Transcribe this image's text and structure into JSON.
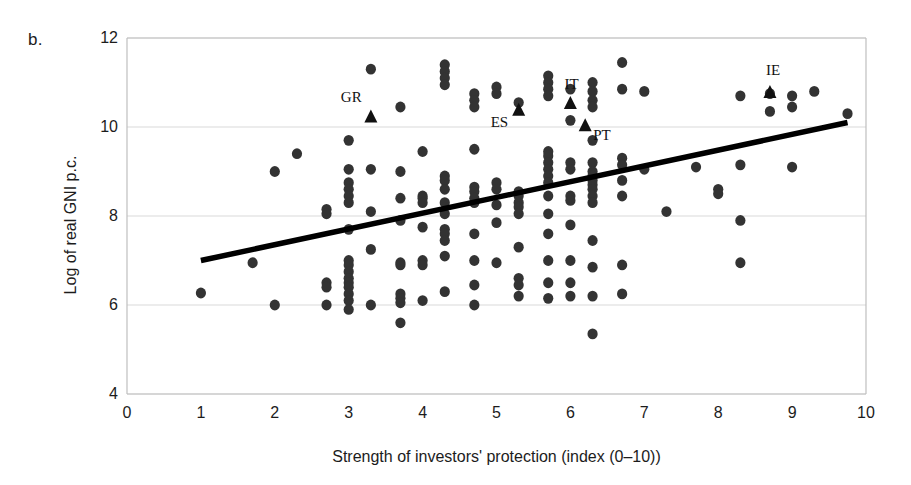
{
  "panel": {
    "label": "b."
  },
  "axes": {
    "x_title": "Strength of investors' protection (index (0–10))",
    "y_title": "Log of real GNI p.c.",
    "x_ticks": [
      "0",
      "1",
      "2",
      "3",
      "4",
      "5",
      "6",
      "7",
      "8",
      "9",
      "10"
    ],
    "y_ticks": [
      "12",
      "10",
      "8",
      "6",
      "4"
    ]
  },
  "labels": {
    "gr": "GR",
    "es": "ES",
    "it": "IT",
    "pt": "PT",
    "ie": "IE"
  },
  "colors": {
    "point": "#333333",
    "marker": "#111111",
    "trendline": "#000000",
    "gridline": "#d9d9d9",
    "axis": "#bfbfbf",
    "text": "#1c1c1c"
  },
  "chart_data": {
    "type": "scatter",
    "title": "",
    "subtitle": "",
    "xlabel": "Strength of investors' protection (index (0–10))",
    "ylabel": "Log of real GNI p.c.",
    "xlim": [
      0,
      10
    ],
    "ylim": [
      4,
      12
    ],
    "xticks": [
      0,
      1,
      2,
      3,
      4,
      5,
      6,
      7,
      8,
      9,
      10
    ],
    "yticks": [
      4,
      6,
      8,
      10,
      12
    ],
    "grid": "horizontal",
    "legend": "none",
    "series": [
      {
        "name": "Countries",
        "marker": "circle",
        "points": [
          [
            1.0,
            6.27
          ],
          [
            1.7,
            6.95
          ],
          [
            2.0,
            9.0
          ],
          [
            2.0,
            6.0
          ],
          [
            2.3,
            9.4
          ],
          [
            2.7,
            8.15
          ],
          [
            2.7,
            8.05
          ],
          [
            2.7,
            6.5
          ],
          [
            2.7,
            6.4
          ],
          [
            2.7,
            6.0
          ],
          [
            3.0,
            9.7
          ],
          [
            3.0,
            9.05
          ],
          [
            3.0,
            8.75
          ],
          [
            3.0,
            8.6
          ],
          [
            3.0,
            8.45
          ],
          [
            3.0,
            8.3
          ],
          [
            3.0,
            7.7
          ],
          [
            3.0,
            7.0
          ],
          [
            3.0,
            6.9
          ],
          [
            3.0,
            6.75
          ],
          [
            3.0,
            6.6
          ],
          [
            3.0,
            6.5
          ],
          [
            3.0,
            6.4
          ],
          [
            3.0,
            6.25
          ],
          [
            3.0,
            6.1
          ],
          [
            3.0,
            5.9
          ],
          [
            3.3,
            11.3
          ],
          [
            3.3,
            9.05
          ],
          [
            3.3,
            8.1
          ],
          [
            3.3,
            7.25
          ],
          [
            3.3,
            6.0
          ],
          [
            3.7,
            10.45
          ],
          [
            3.7,
            9.0
          ],
          [
            3.7,
            8.4
          ],
          [
            3.7,
            7.9
          ],
          [
            3.7,
            6.95
          ],
          [
            3.7,
            6.9
          ],
          [
            3.7,
            6.25
          ],
          [
            3.7,
            6.15
          ],
          [
            3.7,
            6.05
          ],
          [
            3.7,
            5.6
          ],
          [
            4.0,
            9.45
          ],
          [
            4.0,
            8.45
          ],
          [
            4.0,
            8.4
          ],
          [
            4.0,
            8.3
          ],
          [
            4.0,
            7.75
          ],
          [
            4.0,
            7.0
          ],
          [
            4.0,
            6.9
          ],
          [
            4.0,
            6.1
          ],
          [
            4.3,
            11.4
          ],
          [
            4.3,
            11.25
          ],
          [
            4.3,
            11.1
          ],
          [
            4.3,
            10.95
          ],
          [
            4.3,
            8.9
          ],
          [
            4.3,
            8.8
          ],
          [
            4.3,
            8.6
          ],
          [
            4.3,
            8.3
          ],
          [
            4.3,
            8.05
          ],
          [
            4.3,
            7.7
          ],
          [
            4.3,
            7.6
          ],
          [
            4.3,
            7.45
          ],
          [
            4.3,
            7.1
          ],
          [
            4.3,
            6.3
          ],
          [
            4.7,
            10.75
          ],
          [
            4.7,
            10.6
          ],
          [
            4.7,
            10.45
          ],
          [
            4.7,
            9.5
          ],
          [
            4.7,
            8.65
          ],
          [
            4.7,
            8.55
          ],
          [
            4.7,
            8.4
          ],
          [
            4.7,
            8.3
          ],
          [
            4.7,
            7.6
          ],
          [
            4.7,
            7.0
          ],
          [
            4.7,
            6.45
          ],
          [
            4.7,
            6.0
          ],
          [
            5.0,
            10.9
          ],
          [
            5.0,
            10.75
          ],
          [
            5.0,
            8.75
          ],
          [
            5.0,
            8.6
          ],
          [
            5.0,
            8.25
          ],
          [
            5.0,
            7.85
          ],
          [
            5.0,
            6.95
          ],
          [
            5.3,
            10.55
          ],
          [
            5.3,
            8.55
          ],
          [
            5.3,
            8.45
          ],
          [
            5.3,
            8.3
          ],
          [
            5.3,
            8.2
          ],
          [
            5.3,
            8.05
          ],
          [
            5.3,
            7.3
          ],
          [
            5.3,
            6.6
          ],
          [
            5.3,
            6.45
          ],
          [
            5.3,
            6.2
          ],
          [
            5.7,
            11.15
          ],
          [
            5.7,
            11.0
          ],
          [
            5.7,
            10.85
          ],
          [
            5.7,
            10.7
          ],
          [
            5.7,
            9.45
          ],
          [
            5.7,
            9.35
          ],
          [
            5.7,
            9.2
          ],
          [
            5.7,
            9.05
          ],
          [
            5.7,
            8.9
          ],
          [
            5.7,
            8.75
          ],
          [
            5.7,
            8.45
          ],
          [
            5.7,
            8.05
          ],
          [
            5.7,
            7.6
          ],
          [
            5.7,
            7.0
          ],
          [
            5.7,
            6.5
          ],
          [
            5.7,
            6.15
          ],
          [
            6.0,
            10.85
          ],
          [
            6.0,
            10.15
          ],
          [
            6.0,
            9.2
          ],
          [
            6.0,
            9.05
          ],
          [
            6.0,
            8.45
          ],
          [
            6.0,
            8.35
          ],
          [
            6.0,
            7.8
          ],
          [
            6.0,
            7.0
          ],
          [
            6.0,
            6.5
          ],
          [
            6.0,
            6.2
          ],
          [
            6.3,
            11.0
          ],
          [
            6.3,
            10.8
          ],
          [
            6.3,
            10.6
          ],
          [
            6.3,
            10.45
          ],
          [
            6.3,
            9.7
          ],
          [
            6.3,
            9.2
          ],
          [
            6.3,
            9.0
          ],
          [
            6.3,
            8.9
          ],
          [
            6.3,
            8.8
          ],
          [
            6.3,
            8.7
          ],
          [
            6.3,
            8.6
          ],
          [
            6.3,
            8.45
          ],
          [
            6.3,
            8.3
          ],
          [
            6.3,
            7.45
          ],
          [
            6.3,
            6.85
          ],
          [
            6.3,
            6.2
          ],
          [
            6.3,
            5.35
          ],
          [
            6.7,
            11.45
          ],
          [
            6.7,
            10.85
          ],
          [
            6.7,
            9.3
          ],
          [
            6.7,
            9.15
          ],
          [
            6.7,
            8.8
          ],
          [
            6.7,
            8.45
          ],
          [
            6.7,
            6.9
          ],
          [
            6.7,
            6.25
          ],
          [
            7.0,
            10.8
          ],
          [
            7.0,
            9.05
          ],
          [
            7.3,
            8.1
          ],
          [
            7.7,
            9.1
          ],
          [
            8.0,
            8.6
          ],
          [
            8.0,
            8.5
          ],
          [
            8.3,
            10.7
          ],
          [
            8.3,
            9.15
          ],
          [
            8.3,
            7.9
          ],
          [
            8.3,
            6.95
          ],
          [
            8.7,
            10.75
          ],
          [
            8.7,
            10.35
          ],
          [
            9.0,
            10.7
          ],
          [
            9.0,
            10.45
          ],
          [
            9.0,
            9.1
          ],
          [
            9.3,
            10.8
          ],
          [
            9.75,
            10.3
          ]
        ]
      },
      {
        "name": "Highlighted countries",
        "marker": "triangle",
        "points": [
          {
            "code": "GR",
            "x": 3.3,
            "y": 10.25
          },
          {
            "code": "ES",
            "x": 5.3,
            "y": 10.4
          },
          {
            "code": "IT",
            "x": 6.0,
            "y": 10.55
          },
          {
            "code": "PT",
            "x": 6.2,
            "y": 10.05
          },
          {
            "code": "IE",
            "x": 8.7,
            "y": 10.8
          }
        ]
      }
    ],
    "trendline": {
      "type": "linear",
      "x_start": 1.0,
      "y_start": 7.0,
      "x_end": 9.75,
      "y_end": 10.1
    }
  }
}
